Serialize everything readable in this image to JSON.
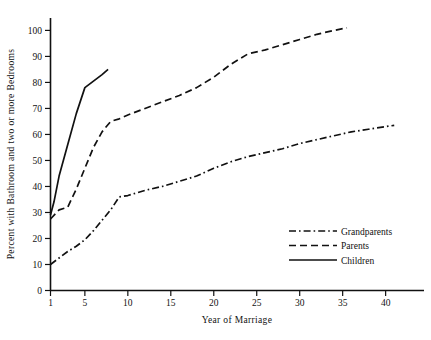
{
  "chart_data": {
    "type": "line",
    "title": "",
    "xlabel": "Year of Marriage",
    "ylabel": "Percent with Bathroom and two or more Bedrooms",
    "xlim": [
      1,
      44
    ],
    "ylim": [
      0,
      104
    ],
    "grid": false,
    "legend_position": "bottom-right",
    "x_ticks": [
      1,
      5,
      10,
      15,
      20,
      25,
      30,
      35,
      40
    ],
    "x_tick_labels": [
      "1",
      "5",
      "10",
      "15",
      "20",
      "25",
      "30",
      "35",
      "40"
    ],
    "y_ticks": [
      0,
      10,
      20,
      30,
      40,
      50,
      60,
      70,
      80,
      90,
      100
    ],
    "y_tick_labels": [
      "0",
      "10",
      "20",
      "30",
      "40",
      "50",
      "60",
      "70",
      "80",
      "90",
      "100"
    ],
    "series": [
      {
        "name": "Grandparents",
        "style": "dashdot",
        "color": "#111111",
        "x": [
          1,
          2,
          3,
          4,
          5,
          6,
          7,
          8,
          9,
          10,
          12,
          14,
          16,
          18,
          20,
          22,
          24,
          26,
          28,
          30,
          32,
          34,
          36,
          38,
          40,
          41
        ],
        "y": [
          10,
          12.5,
          15,
          17,
          19.5,
          23,
          27,
          31,
          36,
          36.5,
          38.5,
          40,
          42,
          44,
          47,
          49.5,
          51.5,
          53,
          54.5,
          56.5,
          58,
          59.5,
          61,
          62,
          63,
          63.5
        ]
      },
      {
        "name": "Parents",
        "style": "dashed",
        "color": "#111111",
        "x": [
          1,
          2,
          3,
          4,
          5,
          6,
          7,
          8,
          9,
          10,
          12,
          14,
          16,
          18,
          20,
          22,
          24,
          26,
          28,
          30,
          32,
          34,
          35.5
        ],
        "y": [
          27.5,
          31,
          32,
          39,
          47,
          55,
          61,
          65,
          66,
          67.5,
          70,
          72.5,
          75,
          78,
          82,
          87,
          91,
          92.5,
          94.5,
          96.5,
          98.5,
          100,
          101
        ]
      },
      {
        "name": "Children",
        "style": "solid",
        "color": "#111111",
        "x": [
          1,
          1.4,
          2,
          3,
          4,
          5,
          6,
          7,
          7.7
        ],
        "y": [
          29,
          34,
          44,
          56,
          68,
          78,
          80.5,
          83,
          85
        ]
      }
    ]
  },
  "legend": {
    "entries": [
      {
        "label": "Grandparents",
        "style": "dashdot"
      },
      {
        "label": "Parents",
        "style": "dashed"
      },
      {
        "label": "Children",
        "style": "solid"
      }
    ]
  }
}
